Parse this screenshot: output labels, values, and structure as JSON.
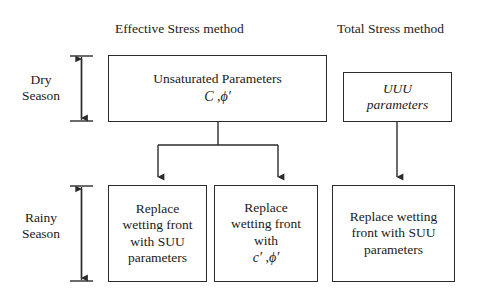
{
  "diagram": {
    "headers": [
      {
        "id": "effective-stress",
        "label": "Effective Stress method"
      },
      {
        "id": "total-stress",
        "label": "Total Stress method"
      }
    ],
    "season_labels": [
      {
        "id": "dry",
        "line1": "Dry",
        "line2": "Season"
      },
      {
        "id": "rainy",
        "line1": "Rainy",
        "line2": "Season"
      }
    ],
    "boxes": {
      "unsaturated": {
        "line1": "Unsaturated Parameters",
        "line2": "C ,ϕ′"
      },
      "uuu": {
        "line1": "UUU",
        "line2": "parameters"
      },
      "replace_suu_left": {
        "line1": "Replace",
        "line2": "wetting front",
        "line3": "with SUU",
        "line4": "parameters"
      },
      "replace_cphi": {
        "line1": "Replace",
        "line2": "wetting front",
        "line3": "with",
        "line4": "c′ ,ϕ′"
      },
      "replace_suu_right": {
        "line1": "Replace wetting",
        "line2": "front with SUU",
        "line3": "parameters"
      }
    },
    "colors": {
      "stroke": "#2b2b2b",
      "text": "#1a1a1a",
      "background": "#ffffff"
    }
  }
}
